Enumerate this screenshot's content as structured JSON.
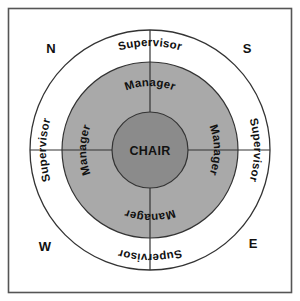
{
  "diagram": {
    "frame": {
      "border_color": "#555555",
      "background_color": "#ffffff"
    },
    "colors": {
      "outer_ring_fill": "#ffffff",
      "middle_ring_fill": "#a9a9a9",
      "center_fill": "#8b8b8b",
      "stroke": "#333333",
      "text": "#111111"
    },
    "center": {
      "label": "CHAIR"
    },
    "rings": [
      {
        "name": "middle-ring",
        "label": "Manager",
        "fill": "#a9a9a9"
      },
      {
        "name": "outer-ring",
        "label": "Supervisor",
        "fill": "#ffffff"
      }
    ],
    "quadrants": [
      {
        "id": "north",
        "compass_label": "N",
        "ring_labels": {
          "outer": "Supervisor",
          "middle": "Manager"
        }
      },
      {
        "id": "south",
        "compass_label": "S",
        "ring_labels": {
          "outer": "Supervisor",
          "middle": "Manager"
        }
      },
      {
        "id": "west",
        "compass_label": "W",
        "ring_labels": {
          "outer": "Supervisor",
          "middle": "Manager"
        }
      },
      {
        "id": "east",
        "compass_label": "E",
        "ring_labels": {
          "outer": "Supervisor",
          "middle": "Manager"
        }
      }
    ]
  }
}
